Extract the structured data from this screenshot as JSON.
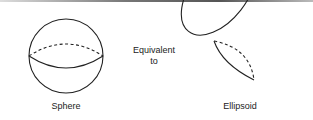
{
  "figure": {
    "left_shape": {
      "name": "sphere",
      "label": "Sphere"
    },
    "middle_text": {
      "line1": "Equivalent",
      "line2": "to"
    },
    "right_shape": {
      "name": "ellipsoid",
      "label": "Ellipsoid"
    },
    "line_color": "#222222"
  }
}
